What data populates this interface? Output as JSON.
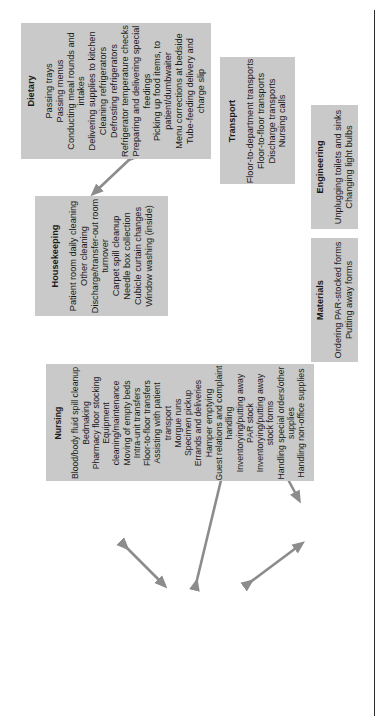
{
  "figure": {
    "kind": "hospital-department-task-relationship-diagram",
    "orientation": "rotated-90-ccw",
    "box_fill": "#c9c9c9",
    "arrow_color": "#8c8c8c",
    "text_color": "#1a1a1a",
    "background": "#ffffff"
  },
  "departments": {
    "dietary": {
      "title": "Dietary",
      "tasks": [
        "Passing trays",
        "Passing menus",
        "Conducting meal rounds and intakes",
        "Delivering supplies to kitchen",
        "Cleaning refrigerators",
        "Defrosting refrigerators",
        "Refrigerator temperature checks",
        "Preparing and delivering special feedings",
        "Picking up food items, to patient/dumbwaiter",
        "Menu corrections at bedside",
        "Tube-feeding delivery and charge slip"
      ]
    },
    "transport": {
      "title": "Transport",
      "tasks": [
        "Floor-to-department transports",
        "Floor-to-floor transports",
        "Discharge transports",
        "Nursing calls"
      ]
    },
    "engineering": {
      "title": "Engineering",
      "tasks": [
        "Unplugging toilets and sinks",
        "Changing light bulbs"
      ]
    },
    "housekeeping": {
      "title": "Housekeeping",
      "tasks": [
        "Patient room daily cleaning",
        "Other cleaning",
        "Discharge/transfer-out room turnover",
        "Carpet spill cleanup",
        "Needle box collection",
        "Cubicle curtain changes",
        "Window washing (inside)"
      ]
    },
    "materials": {
      "title": "Materials",
      "tasks": [
        "Ordering PAR-stocked forms",
        "Putting away forms"
      ]
    },
    "nursing": {
      "title": "Nursing",
      "tasks": [
        "Blood/body fluid spill cleanup",
        "Bedmaking",
        "Pharmacy floor stocking",
        "Equipment cleaning/maintenance",
        "Moving of empty beds",
        "Intra-unit transfers",
        "Floor-to-floor transfers",
        "Assisting with patient transport",
        "Morgue runs",
        "Specimen pickup",
        "Errands and deliveries",
        "Hamper emptying",
        "Guest relations and complaint handling",
        "Inventorying/putting away PAR stock",
        "Inventorying/putting away stock forms",
        "Handling special orders/other supplies",
        "Handling non-office supplies"
      ]
    }
  },
  "connections": [
    {
      "id": "dietary-housekeeping",
      "from": "Dietary",
      "to": "Housekeeping",
      "style": "double-headed"
    },
    {
      "id": "housekeeping-nursing",
      "from": "Housekeeping",
      "to": "Nursing",
      "style": "double-headed"
    },
    {
      "id": "nursing-transport",
      "from": "Nursing",
      "to": "Transport",
      "style": "double-headed"
    },
    {
      "id": "transport-materials",
      "from": "Transport",
      "to": "Materials",
      "style": "double-headed"
    },
    {
      "id": "nursing-materials",
      "from": "Nursing",
      "to": "Materials",
      "style": "double-headed"
    }
  ]
}
